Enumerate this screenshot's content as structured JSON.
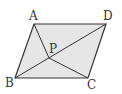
{
  "diagram": {
    "type": "geometry",
    "shape": "parallelogram",
    "fill_color": "#e6e6e6",
    "stroke_color": "#333333",
    "vertices": {
      "A": {
        "label": "A",
        "x": 34,
        "y": 24
      },
      "D": {
        "label": "D",
        "x": 106,
        "y": 24
      },
      "C": {
        "label": "C",
        "x": 88,
        "y": 78
      },
      "B": {
        "label": "B",
        "x": 15,
        "y": 78
      }
    },
    "point_P": {
      "label": "P",
      "x": 49,
      "y": 58
    },
    "segments": [
      "AB",
      "BC",
      "CD",
      "DA",
      "BD",
      "AP",
      "PC"
    ]
  }
}
